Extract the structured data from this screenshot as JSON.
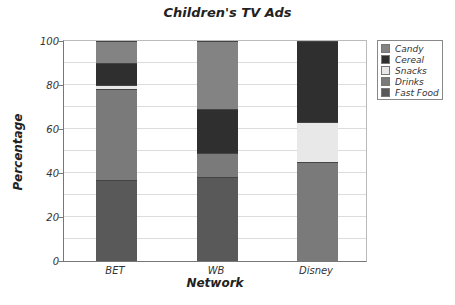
{
  "chart_data": {
    "type": "bar",
    "stacked": true,
    "title": "Children's TV Ads",
    "xlabel": "Network",
    "ylabel": "Percentage",
    "ylim": [
      0,
      100
    ],
    "yticks": [
      0,
      20,
      40,
      60,
      80,
      100
    ],
    "grid": true,
    "gridlines_every": 10,
    "legend_position": "right",
    "categories": [
      "BET",
      "WB",
      "Disney"
    ],
    "series": [
      {
        "name": "Fast Food",
        "color": "#595959",
        "values": [
          37,
          38,
          0
        ]
      },
      {
        "name": "Drinks",
        "color": "#7a7a7a",
        "values": [
          41,
          11,
          45
        ]
      },
      {
        "name": "Snacks",
        "color": "#e8e8e8",
        "values": [
          2,
          0,
          18
        ]
      },
      {
        "name": "Cereal",
        "color": "#2f2f2f",
        "values": [
          10,
          20,
          37
        ]
      },
      {
        "name": "Candy",
        "color": "#838383",
        "values": [
          10,
          31,
          0
        ]
      }
    ],
    "legend_order": [
      "Candy",
      "Cereal",
      "Snacks",
      "Drinks",
      "Fast Food"
    ]
  }
}
